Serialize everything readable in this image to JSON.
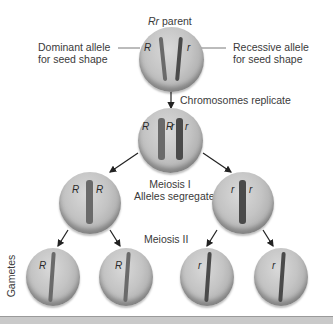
{
  "diagram": {
    "parent_label_italic": "Rr",
    "parent_label_rest": " parent",
    "left_callout": [
      "Dominant allele",
      "for seed shape"
    ],
    "right_callout": [
      "Recessive allele",
      "for seed shape"
    ],
    "step1": "Chromosomes replicate",
    "step2": [
      "Meiosis I",
      "Alleles segregate"
    ],
    "step3": "Meiosis II",
    "side_label": "Gametes",
    "alleles": {
      "dominant": "R",
      "recessive": "r"
    },
    "colors": {
      "cell": "#c4c4c4",
      "chromosome_dominant": "#6a6a6a",
      "chromosome_recessive": "#3a3a3a",
      "arrow": "#222222",
      "bottom_bar": "#c9c9c9"
    }
  }
}
